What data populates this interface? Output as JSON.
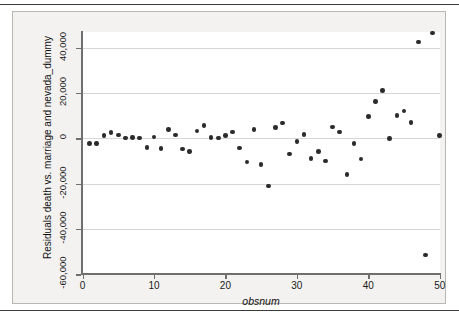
{
  "figure": {
    "kind": "stata-scatter-graph",
    "background_color": "#f3f2f0",
    "canvas_color": "#ffffff",
    "marker_color": "#2b2b2b",
    "axis_color": "#6f6f6f",
    "grid_color": "#d8d8d8"
  },
  "chart_data": {
    "type": "scatter",
    "title": "",
    "subtitle": "",
    "xlabel": "obsnum",
    "ylabel": "Residuals death vs. marriage and nevada_dummy",
    "xlim": [
      0,
      51
    ],
    "ylim": [
      -60000,
      46000
    ],
    "xticks": [
      0,
      10,
      20,
      30,
      40,
      50
    ],
    "xticklabels": [
      "0",
      "10",
      "20",
      "30",
      "40",
      "50"
    ],
    "yticks": [
      40000,
      20000,
      0,
      -20000,
      -40000,
      -60000
    ],
    "yticklabels": [
      "40,000",
      "20,000",
      "0",
      "-20,000",
      "-40,000",
      "-60,000"
    ],
    "grid": "horizontal",
    "legend": null,
    "marker": "filled-circle",
    "series": [
      {
        "name": "Residuals death vs. marriage and nevada_dummy",
        "x": [
          1,
          2,
          3,
          4,
          5,
          6,
          7,
          8,
          9,
          10,
          11,
          12,
          13,
          14,
          15,
          16,
          17,
          18,
          19,
          20,
          21,
          22,
          23,
          24,
          25,
          26,
          27,
          28,
          29,
          30,
          31,
          32,
          33,
          34,
          35,
          36,
          37,
          38,
          39,
          40,
          41,
          42,
          43,
          44,
          45,
          46,
          47,
          48,
          49,
          50
        ],
        "y": [
          -2200,
          -2300,
          1300,
          2500,
          1400,
          200,
          300,
          200,
          -4100,
          500,
          -4600,
          4000,
          1400,
          -4700,
          -5700,
          3300,
          5600,
          400,
          200,
          1200,
          2700,
          -4200,
          -10500,
          3900,
          -11500,
          -21000,
          4700,
          6700,
          -6900,
          -1300,
          1700,
          -8800,
          -5800,
          -10000,
          4900,
          2700,
          -16000,
          -2300,
          -9200,
          9500,
          16200,
          21200,
          0,
          10000,
          12000,
          7000,
          42500,
          -51500,
          46500,
          1300
        ]
      }
    ]
  },
  "axis_titles": {
    "y": "Residuals death vs. marriage and nevada_dummy",
    "x": "obsnum"
  }
}
